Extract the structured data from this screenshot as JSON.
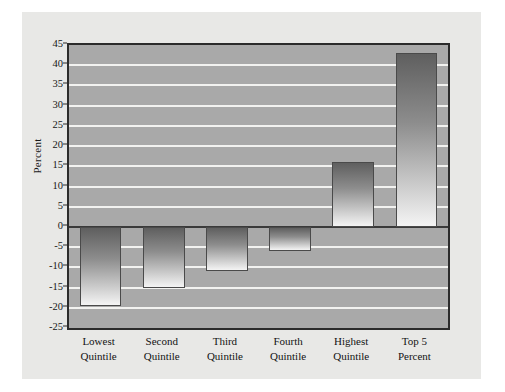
{
  "figure": {
    "page_background": "#ffffff",
    "panel_background": "#e8e8e6",
    "plot_background": "#a9a9a9",
    "gridline_color": "#f2f2f0",
    "axis_color": "#2b2b2b",
    "bar_edge_color": "#4a4a4a",
    "bar_fill_top": "#5f5f5f",
    "bar_fill_bottom": "#f4f4f4"
  },
  "chart_data": {
    "type": "bar",
    "title": "",
    "xlabel": "",
    "ylabel": "Percent",
    "ylim": [
      -25,
      45
    ],
    "ytick_step": 5,
    "yticks": [
      45,
      40,
      35,
      30,
      25,
      20,
      15,
      10,
      5,
      0,
      -5,
      -10,
      -15,
      -20,
      -25
    ],
    "ytick_labels": [
      "45",
      "40",
      "35",
      "30",
      "25",
      "20",
      "15",
      "10",
      "5",
      "0",
      "-5",
      "-10",
      "-15",
      "-20",
      "-25"
    ],
    "grid": true,
    "grid_axis": "y",
    "legend": false,
    "legend_position": "none",
    "zero_line": 0,
    "categories": [
      "Lowest Quintile",
      "Second Quintile",
      "Third Quintile",
      "Fourth Quintile",
      "Highest Quintile",
      "Top 5 Percent"
    ],
    "category_lines": [
      [
        "Lowest",
        "Quintile"
      ],
      [
        "Second",
        "Quintile"
      ],
      [
        "Third",
        "Quintile"
      ],
      [
        "Fourth",
        "Quintile"
      ],
      [
        "Highest",
        "Quintile"
      ],
      [
        "Top 5",
        "Percent"
      ]
    ],
    "values": [
      -19.5,
      -15.0,
      -11.0,
      -6.0,
      16.0,
      43.0
    ]
  }
}
